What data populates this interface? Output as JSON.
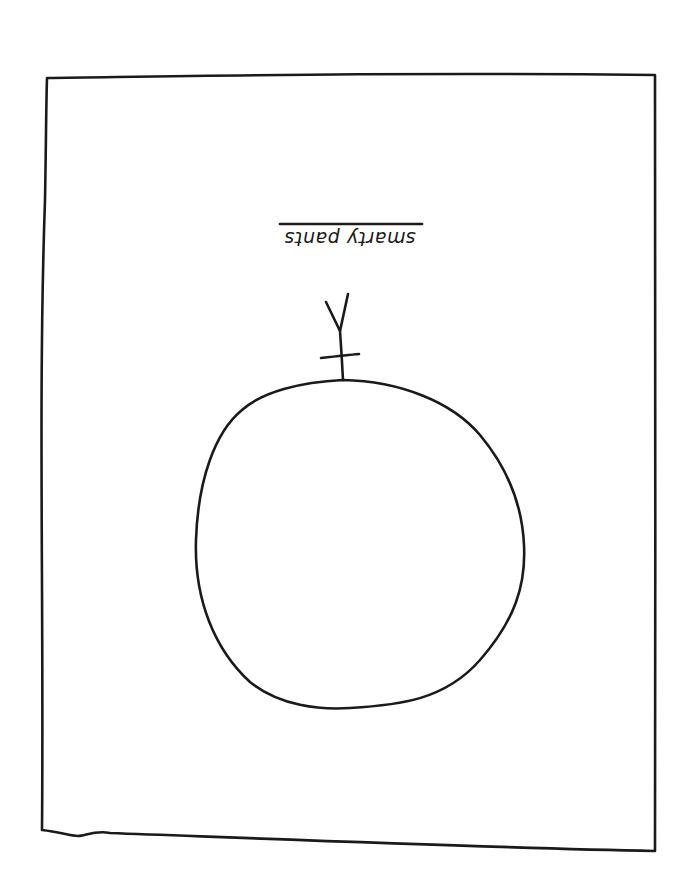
{
  "drawing": {
    "caption": {
      "text": "smarty pants",
      "orientation": "upside-down (rotated 180°)",
      "underlined": true
    },
    "frame": {
      "shape": "hand-drawn rectangle",
      "corners": {
        "top_left": [
          47,
          77
        ],
        "top_right": [
          655,
          75
        ],
        "bottom_right": [
          655,
          851
        ],
        "bottom_left": [
          42,
          830
        ]
      }
    },
    "figure": {
      "body": "hand-drawn circle",
      "stem": "vertical line with crossbar and Y-shaped fork on top of circle"
    },
    "colors": {
      "ink": "#1a1a1a",
      "paper": "#ffffff"
    }
  }
}
